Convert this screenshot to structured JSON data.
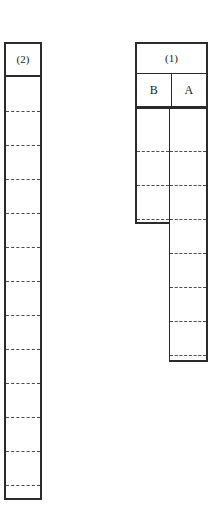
{
  "figure": {
    "background_color": "#ffffff",
    "stroke_color": "#2b2b2b",
    "dash_color": "#4a4a4a",
    "columns": [
      {
        "id": "col2",
        "header_label": "(2)",
        "name": "column-2",
        "rule_count": 12
      },
      {
        "id": "col1",
        "header_label": "(1)",
        "name": "column-1",
        "subcolumns": [
          {
            "id": "colB",
            "header_label": "B",
            "name": "subcolumn-b",
            "rule_count": 3
          },
          {
            "id": "colA",
            "header_label": "A",
            "name": "subcolumn-a",
            "rule_count": 7
          }
        ]
      }
    ]
  },
  "dash_rules": {
    "col2_offsets_px": [
      36,
      70,
      104,
      138,
      172,
      206,
      240,
      274,
      308,
      342,
      376,
      410
    ],
    "colB_offsets_px": [
      43,
      77,
      111
    ],
    "colA_offsets_px": [
      43,
      77,
      111,
      145,
      179,
      213,
      247
    ]
  }
}
